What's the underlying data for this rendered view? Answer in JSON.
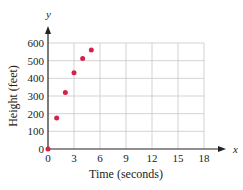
{
  "chart_data": {
    "type": "scatter",
    "title": "",
    "xlabel": "Time (seconds)",
    "ylabel": "Height (feet)",
    "x_axis_var": "x",
    "y_axis_var": "y",
    "xlim": [
      0,
      18
    ],
    "ylim": [
      0,
      600
    ],
    "x_ticks": [
      0,
      3,
      6,
      9,
      12,
      15,
      18
    ],
    "y_ticks": [
      0,
      100,
      200,
      300,
      400,
      500,
      600
    ],
    "grid": true,
    "legend": null,
    "point_color": "#d6204a",
    "series": [
      {
        "name": "Height",
        "x": [
          0,
          1,
          2,
          3,
          4,
          5
        ],
        "y": [
          0,
          176,
          320,
          432,
          512,
          560
        ]
      }
    ]
  }
}
